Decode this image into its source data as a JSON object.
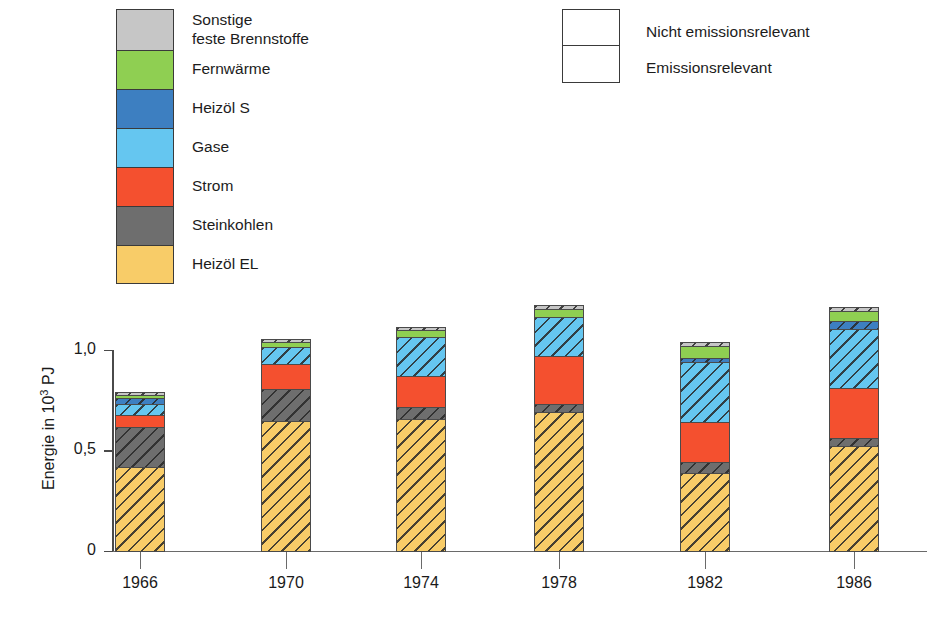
{
  "legend_colors": {
    "title": "",
    "items": [
      {
        "label": "Sonstige\nfeste Brennstoffe",
        "key": "sonstige",
        "color": "#c6c6c6"
      },
      {
        "label": "Fernwärme",
        "key": "fernwaerme",
        "color": "#8fcf52"
      },
      {
        "label": "Heizöl S",
        "key": "heizoel_s",
        "color": "#3d7fc1"
      },
      {
        "label": "Gase",
        "key": "gase",
        "color": "#65c6f0"
      },
      {
        "label": "Strom",
        "key": "strom",
        "color": "#f4502f"
      },
      {
        "label": "Steinkohlen",
        "key": "steinkohlen",
        "color": "#6e6e6e"
      },
      {
        "label": "Heizöl EL",
        "key": "heizoel_el",
        "color": "#f8cc68"
      }
    ]
  },
  "legend_hatch": {
    "items": [
      {
        "label": "Nicht emissionsrelevant",
        "pattern": "plain"
      },
      {
        "label": "Emissionsrelevant",
        "pattern": "hatched"
      }
    ]
  },
  "chart_data": {
    "type": "bar",
    "subtype": "stacked",
    "title": "",
    "xlabel": "",
    "ylabel": "Energie in 10³ PJ",
    "ylabel_parts": {
      "pre": "Energie in 10",
      "sup": "3",
      "post": " PJ"
    },
    "ylim": [
      0,
      1.0
    ],
    "ytick_labels": [
      "0",
      "0,5",
      "1,0"
    ],
    "ytick_values": [
      0,
      0.5,
      1.0
    ],
    "grid": false,
    "legend_position": "top",
    "categories": [
      "1966",
      "1970",
      "1974",
      "1978",
      "1982",
      "1986"
    ],
    "series": [
      {
        "name": "Heizöl EL",
        "key": "heizoel_el",
        "color": "#f8cc68",
        "hatched": true,
        "values": [
          0.415,
          0.645,
          0.655,
          0.69,
          0.385,
          0.52
        ]
      },
      {
        "name": "Steinkohlen",
        "key": "steinkohlen",
        "color": "#6e6e6e",
        "hatched": true,
        "values": [
          0.2,
          0.16,
          0.06,
          0.04,
          0.055,
          0.04
        ]
      },
      {
        "name": "Strom",
        "key": "strom",
        "color": "#f4502f",
        "hatched": false,
        "values": [
          0.06,
          0.125,
          0.155,
          0.24,
          0.2,
          0.25
        ]
      },
      {
        "name": "Gase",
        "key": "gase",
        "color": "#65c6f0",
        "hatched": true,
        "values": [
          0.055,
          0.08,
          0.19,
          0.19,
          0.3,
          0.29
        ]
      },
      {
        "name": "Heizöl S",
        "key": "heizoel_s",
        "color": "#3d7fc1",
        "hatched": true,
        "values": [
          0.03,
          0.0,
          0.0,
          0.0,
          0.02,
          0.04
        ]
      },
      {
        "name": "Fernwärme",
        "key": "fernwaerme",
        "color": "#8fcf52",
        "hatched": false,
        "values": [
          0.012,
          0.025,
          0.035,
          0.04,
          0.055,
          0.05
        ]
      },
      {
        "name": "Sonstige feste Brennstoffe",
        "key": "sonstige",
        "color": "#c6c6c6",
        "hatched": true,
        "values": [
          0.018,
          0.015,
          0.015,
          0.02,
          0.02,
          0.02
        ]
      }
    ],
    "totals": [
      0.79,
      1.05,
      1.11,
      1.22,
      1.035,
      1.21
    ]
  }
}
